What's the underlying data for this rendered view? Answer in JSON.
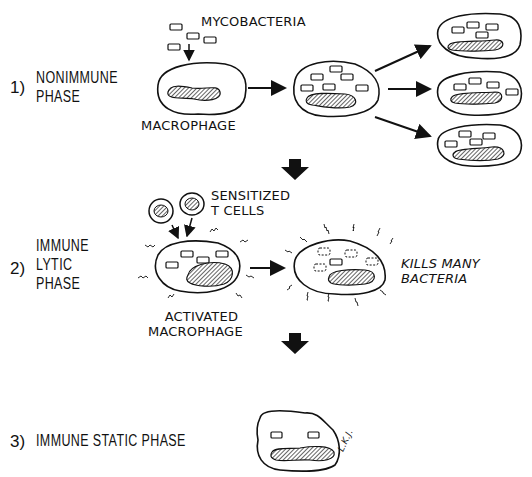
{
  "diagram": {
    "phases": [
      {
        "number": "1)",
        "title_line1": "NONIMMUNE",
        "title_line2": "PHASE"
      },
      {
        "number": "2)",
        "title_line1": "IMMUNE",
        "title_line2": "LYTIC",
        "title_line3": "PHASE"
      },
      {
        "number": "3)",
        "title": "IMMUNE STATIC PHASE"
      }
    ],
    "labels": {
      "mycobacteria": "MYCOBACTERIA",
      "macrophage": "MACROPHAGE",
      "sensitized_line1": "SENSITIZED",
      "sensitized_line2": "T CELLS",
      "activated_line1": "ACTIVATED",
      "activated_line2": "MACROPHAGE",
      "kills_line1": "KILLS MANY",
      "kills_line2": "BACTERIA",
      "signature": "L.K.J."
    },
    "colors": {
      "ink": "#111111",
      "background": "#ffffff"
    }
  }
}
